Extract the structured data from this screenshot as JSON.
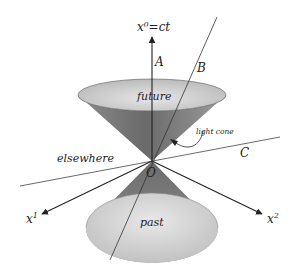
{
  "diagram": {
    "time_axis_label": "x⁰=ct",
    "axis_x1_label": "x",
    "axis_x1_sup": "1",
    "axis_x2_label": "x",
    "axis_x2_sup": "2",
    "origin_label": "O",
    "future_label": "future",
    "past_label": "past",
    "elsewhere_label": "elsewhere",
    "light_cone_label": "light cone",
    "worldline_a_label": "A",
    "worldline_b_label": "B",
    "worldline_c_label": "C",
    "colors": {
      "cone_dark": "#6e6e6e",
      "cone_mid": "#9a9a9a",
      "cone_light": "#d6d6d6",
      "line": "#222222",
      "background": "#ffffff"
    }
  }
}
